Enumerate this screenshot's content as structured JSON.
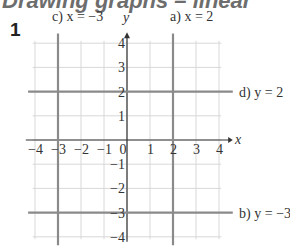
{
  "heading": "Drawing graphs – linear",
  "question_number": "1",
  "chart_data": {
    "type": "line",
    "title": "",
    "xlabel": "x",
    "ylabel": "y",
    "xlim": [
      -4,
      4
    ],
    "ylim": [
      -4,
      4
    ],
    "grid": true,
    "x_ticks": [
      "-4",
      "-3",
      "-2",
      "-1",
      "0",
      "1",
      "2",
      "3",
      "4"
    ],
    "y_ticks": [
      "4",
      "3",
      "2",
      "1",
      "-1",
      "-2",
      "-3",
      "-4"
    ],
    "series": [
      {
        "name": "a) x = 2",
        "orientation": "vertical",
        "value": 2
      },
      {
        "name": "b) y = -3",
        "orientation": "horizontal",
        "value": -3
      },
      {
        "name": "c) x = -3",
        "orientation": "vertical",
        "value": -3
      },
      {
        "name": "d) y = 2",
        "orientation": "horizontal",
        "value": 2
      }
    ]
  },
  "labels": {
    "a": "a) x = 2",
    "b": "b) y = −3",
    "c": "c) x = −3",
    "d": "d) y = 2",
    "x_axis": "x",
    "y_axis": "y"
  },
  "colors": {
    "grid": "#d8d8d8",
    "axis": "#333333",
    "line": "#8a8a8a"
  }
}
